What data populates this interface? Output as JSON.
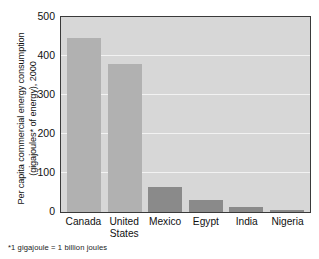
{
  "chart_data": {
    "type": "bar",
    "title": "",
    "xlabel": "",
    "ylabel_line1": "Per capita commercial energy consumption",
    "ylabel_line2": "(gigajoules* of energy), 2000",
    "categories": [
      "Canada",
      "United States",
      "Mexico",
      "Egypt",
      "India",
      "Nigeria"
    ],
    "category_lines": [
      [
        "Canada",
        ""
      ],
      [
        "United",
        "States"
      ],
      [
        "Mexico",
        ""
      ],
      [
        "Egypt",
        ""
      ],
      [
        "India",
        ""
      ],
      [
        "Nigeria",
        ""
      ]
    ],
    "values": [
      447,
      380,
      64,
      31,
      13,
      6
    ],
    "ylim": [
      0,
      500
    ],
    "yticks": [
      0,
      100,
      200,
      300,
      400,
      500
    ],
    "ytick_labels": [
      "0",
      "100",
      "200",
      "300",
      "400",
      "500"
    ],
    "grid": true,
    "legend": "none",
    "footnote": "*1 gigajoule = 1 billion joules",
    "colors": {
      "plot_background": "#d7d7d7",
      "gridline": "#f2f2f2",
      "bar_light": "#b1b1b1",
      "bar_dark": "#8a8a8a",
      "axis": "#3a3a3a",
      "text": "#111111"
    },
    "bar_shades": [
      "light",
      "light",
      "dark",
      "dark",
      "dark",
      "dark"
    ]
  }
}
